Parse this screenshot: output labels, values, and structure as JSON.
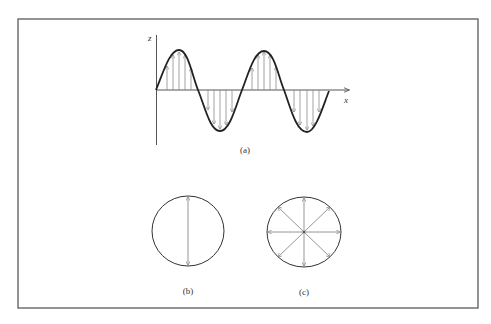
{
  "figure": {
    "panels": [
      {
        "id": "a",
        "label": "(a)",
        "description": "sinusoidal wave with vertical field arrows along x-axis"
      },
      {
        "id": "b",
        "label": "(b)",
        "description": "circle with single vertical double-headed arrow"
      },
      {
        "id": "c",
        "label": "(c)",
        "description": "circle with eight radial arrows"
      }
    ],
    "axes": {
      "vertical_label": "z",
      "horizontal_label": "x"
    },
    "colors": {
      "frame": "#555555",
      "curve": "#222222",
      "arrows": "#8a8a8a",
      "text": "#333333"
    }
  }
}
